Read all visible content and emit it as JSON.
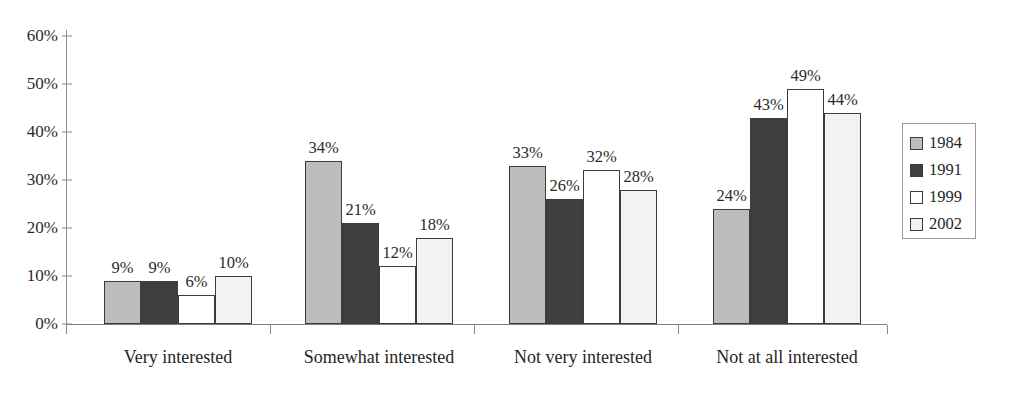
{
  "chart_data": {
    "type": "bar",
    "title": "",
    "subtitle": "",
    "xlabel": "",
    "ylabel": "",
    "ylim": [
      0,
      60
    ],
    "ytick_values": [
      0,
      10,
      20,
      30,
      40,
      50,
      60
    ],
    "ytick_labels": [
      "0%",
      "10%",
      "20%",
      "30%",
      "40%",
      "50%",
      "60%"
    ],
    "grid": false,
    "legend_position": "right",
    "value_labels": true,
    "value_label_suffix": "%",
    "categories": [
      "Very interested",
      "Somewhat interested",
      "Not very interested",
      "Not at all interested"
    ],
    "series": [
      {
        "name": "1984",
        "color": "#bdbdbd",
        "values": [
          9,
          34,
          33,
          24
        ],
        "labels": [
          "9%",
          "34%",
          "33%",
          "24%"
        ]
      },
      {
        "name": "1991",
        "color": "#3f3f3f",
        "values": [
          9,
          21,
          26,
          43
        ],
        "labels": [
          "9%",
          "21%",
          "26%",
          "43%"
        ]
      },
      {
        "name": "1999",
        "color": "#ffffff",
        "values": [
          6,
          12,
          32,
          49
        ],
        "labels": [
          "6%",
          "12%",
          "32%",
          "49%"
        ]
      },
      {
        "name": "2002",
        "color": "#f2f2f2",
        "values": [
          10,
          18,
          28,
          44
        ],
        "labels": [
          "10%",
          "18%",
          "28%",
          "44%"
        ]
      }
    ]
  },
  "legend": {
    "items": [
      {
        "label": "1984",
        "color": "#bdbdbd"
      },
      {
        "label": "1991",
        "color": "#3f3f3f"
      },
      {
        "label": "1999",
        "color": "#ffffff"
      },
      {
        "label": "2002",
        "color": "#f2f2f2"
      }
    ]
  },
  "axis": {
    "bar_outline_color": "#3c3c3c",
    "axis_color": "#8a8a8a"
  }
}
